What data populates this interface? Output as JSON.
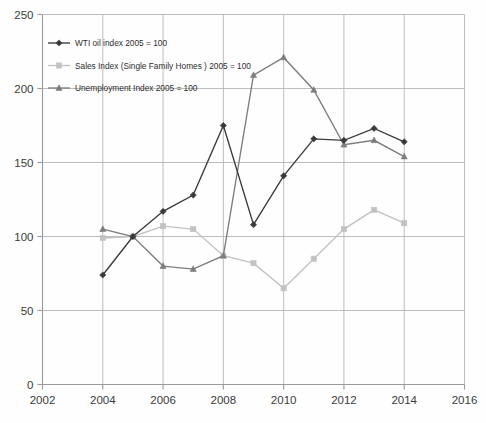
{
  "chart_data": {
    "type": "line",
    "title": "",
    "subtitle": "",
    "xlabel": "",
    "ylabel": "",
    "xlim": [
      2002,
      2016
    ],
    "ylim": [
      0,
      250
    ],
    "x_ticks": [
      2002,
      2004,
      2006,
      2008,
      2010,
      2012,
      2014,
      2016
    ],
    "y_ticks": [
      0,
      50,
      100,
      150,
      200,
      250
    ],
    "grid": true,
    "legend_position": "top-left",
    "x": [
      2004,
      2005,
      2006,
      2007,
      2008,
      2009,
      2010,
      2011,
      2012,
      2013,
      2014
    ],
    "series": [
      {
        "name": "WTI oil index 2005 = 100",
        "color": "#3a3a3a",
        "marker": "diamond",
        "values": [
          74,
          100,
          117,
          128,
          175,
          108,
          141,
          166,
          165,
          173,
          164
        ]
      },
      {
        "name": "Sales Index (Single Family Homes ) 2005 = 100",
        "color": "#c2c2c2",
        "marker": "square",
        "values": [
          99,
          100,
          107,
          105,
          87,
          82,
          65,
          85,
          105,
          118,
          109
        ]
      },
      {
        "name": "Unemployment Index 2005 = 100",
        "color": "#7d7d7d",
        "marker": "triangle",
        "values": [
          105,
          100,
          80,
          78,
          87,
          209,
          221,
          199,
          162,
          165,
          154
        ]
      }
    ]
  },
  "axes": {
    "y_tick_labels": [
      "0",
      "50",
      "100",
      "150",
      "200",
      "250"
    ],
    "x_tick_labels": [
      "2002",
      "2004",
      "2006",
      "2008",
      "2010",
      "2012",
      "2014",
      "2016"
    ]
  },
  "legend": {
    "entries": [
      {
        "label": "WTI oil index 2005 = 100"
      },
      {
        "label": "Sales Index (Single Family Homes ) 2005 = 100"
      },
      {
        "label": "Unemployment Index 2005 = 100"
      }
    ]
  }
}
